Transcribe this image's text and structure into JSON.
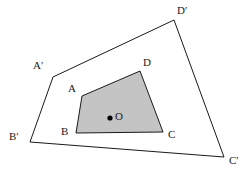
{
  "figure": {
    "canvas": {
      "width": 246,
      "height": 175,
      "background": "#ffffff"
    },
    "colors": {
      "stroke": "#1a1a1a",
      "inner_fill": "#c4c4c4",
      "point_fill": "#000000",
      "label_text": "#1a1a1a"
    },
    "outer_polygon": {
      "name": "A'B'C'D'",
      "fill": "none",
      "stroke_width": 1,
      "vertices": [
        {
          "id": "A-prime",
          "label": "A′",
          "x": 53,
          "y": 77,
          "label_x": 33,
          "label_y": 60
        },
        {
          "id": "B-prime",
          "label": "B′",
          "x": 30,
          "y": 142,
          "label_x": 9,
          "label_y": 131
        },
        {
          "id": "C-prime",
          "label": "C′",
          "x": 224,
          "y": 157,
          "label_x": 229,
          "label_y": 155
        },
        {
          "id": "D-prime",
          "label": "D′",
          "x": 174,
          "y": 20,
          "label_x": 177,
          "label_y": 5
        }
      ],
      "points_attr": "53,77 30,142 224,157 174,20"
    },
    "inner_polygon": {
      "name": "ABCD",
      "fill": "#c4c4c4",
      "stroke_width": 1,
      "vertices": [
        {
          "id": "A",
          "label": "A",
          "x": 82,
          "y": 96,
          "label_x": 68,
          "label_y": 83
        },
        {
          "id": "B",
          "label": "B",
          "x": 76,
          "y": 133,
          "label_x": 61,
          "label_y": 126
        },
        {
          "id": "C",
          "label": "C",
          "x": 163,
          "y": 132,
          "label_x": 168,
          "label_y": 129
        },
        {
          "id": "D",
          "label": "D",
          "x": 140,
          "y": 71,
          "label_x": 143,
          "label_y": 57
        }
      ],
      "points_attr": "82,96 76,133 163,132 140,71"
    },
    "center_point": {
      "id": "O",
      "label": "O",
      "x": 110,
      "y": 118,
      "radius": 2.6,
      "label_x": 115,
      "label_y": 111
    }
  }
}
